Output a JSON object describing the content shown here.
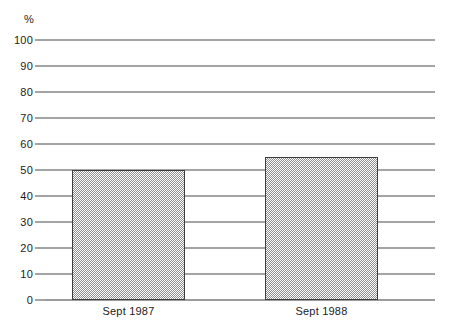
{
  "chart_data": {
    "type": "bar",
    "title": "",
    "xlabel": "",
    "ylabel": "%",
    "unit_label": "%",
    "categories": [
      "Sept 1987",
      "Sept 1988"
    ],
    "values": [
      50,
      55
    ],
    "series": [
      {
        "name": "",
        "values": [
          50,
          55
        ]
      }
    ],
    "ylim": [
      0,
      100
    ],
    "ytick_labels": [
      "100",
      "90",
      "80",
      "70",
      "60",
      "50",
      "40",
      "30",
      "20",
      "10",
      "0"
    ],
    "ytick_values": [
      100,
      90,
      80,
      70,
      60,
      50,
      40,
      30,
      20,
      10,
      0
    ],
    "grid": true,
    "legend": "none",
    "colors": {
      "bar_fill": "#8e8e8e",
      "bar_border": "#3d3d3d",
      "gridline": "#4a4a4a",
      "text": "#1c1c1c",
      "background": "#ffffff"
    }
  }
}
